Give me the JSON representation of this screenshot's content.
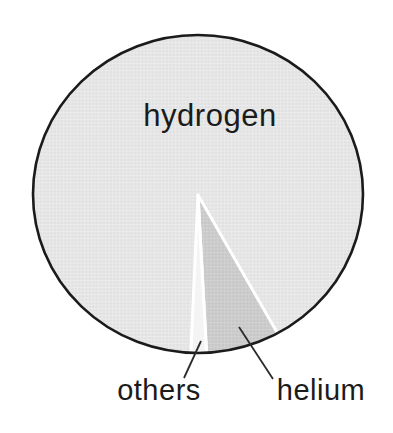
{
  "chart_data": {
    "type": "pie",
    "title": "",
    "labels": [
      "hydrogen",
      "helium",
      "others"
    ],
    "values_pct_estimated": [
      91.3,
      7.2,
      1.5
    ],
    "legend": "none",
    "label_placement": {
      "hydrogen": "inside",
      "helium": "outside-callout",
      "others": "outside-callout"
    },
    "slices": [
      {
        "label": "hydrogen",
        "start_deg": 182.5,
        "end_deg": 511.0,
        "color": "#e1e1e1",
        "fill_pattern": "pat-hydrogen"
      },
      {
        "label": "helium",
        "start_deg": 151.0,
        "end_deg": 177.0,
        "color": "#c6c6c6",
        "fill_pattern": "pat-helium"
      },
      {
        "label": "others",
        "start_deg": 177.0,
        "end_deg": 182.5,
        "color": "#f4f4f4"
      }
    ]
  },
  "labels": {
    "hydrogen": "hydrogen",
    "helium": "helium",
    "others": "others"
  },
  "colors": {
    "background": "#ffffff",
    "outline": "#1b1b1b",
    "separator": "#ffffff",
    "text": "#1b1b1b",
    "leader_line": "#2b2b2b",
    "hydrogen_fill": "#e1e1e1",
    "hydrogen_grid": "#eeeeee",
    "helium_fill": "#c6c6c6",
    "helium_grid": "#d4d4d4",
    "others_fill": "#f4f4f4"
  }
}
